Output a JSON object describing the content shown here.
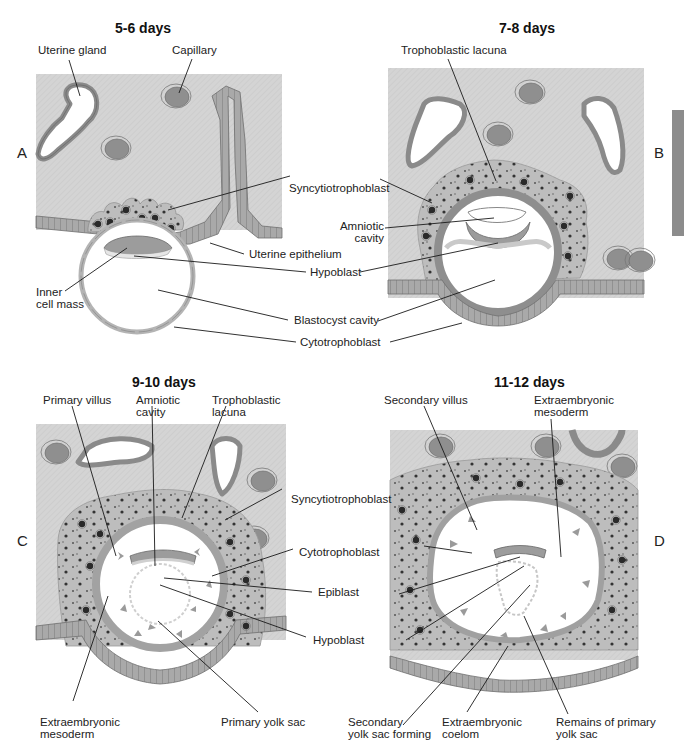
{
  "figure": {
    "type": "embryology-diagram",
    "colors": {
      "endometrium_stroma": "#d4d4d4",
      "epithelium_cells": "#a9a9a9",
      "cell_outline": "#6f6f6f",
      "syncytiotrophoblast": "#bdbdbd",
      "cytotrophoblast": "#9a9a9a",
      "capillary_blood": "#8f8f8f",
      "cavity": "#ffffff",
      "nuclei": "#2a2a2a",
      "leader_lines": "#1a1a1a",
      "side_tab": "#8c8c8c"
    }
  },
  "panels": [
    {
      "letter": "A",
      "title": "5-6 days",
      "labels": [
        {
          "id": "uterine-gland",
          "text": "Uterine gland"
        },
        {
          "id": "capillary",
          "text": "Capillary"
        },
        {
          "id": "inner-cell-mass-1",
          "text": "Inner"
        },
        {
          "id": "inner-cell-mass-2",
          "text": "cell mass"
        }
      ]
    },
    {
      "letter": "B",
      "title": "7-8 days",
      "labels": [
        {
          "id": "trophoblastic-lacuna",
          "text": "Trophoblastic lacuna"
        }
      ]
    },
    {
      "letter": "C",
      "title": "9-10 days",
      "labels": [
        {
          "id": "primary-villus",
          "text": "Primary villus"
        },
        {
          "id": "amniotic-cavity-1",
          "text": "Amniotic"
        },
        {
          "id": "amniotic-cavity-2",
          "text": "cavity"
        },
        {
          "id": "trophoblastic-lacuna-1",
          "text": "Trophoblastic"
        },
        {
          "id": "trophoblastic-lacuna-2",
          "text": "lacuna"
        },
        {
          "id": "extraembryonic-mesoderm-1",
          "text": "Extraembryonic"
        },
        {
          "id": "extraembryonic-mesoderm-2",
          "text": "mesoderm"
        },
        {
          "id": "primary-yolk-sac",
          "text": "Primary yolk sac"
        }
      ]
    },
    {
      "letter": "D",
      "title": "11-12 days",
      "labels": [
        {
          "id": "secondary-villus",
          "text": "Secondary villus"
        },
        {
          "id": "extraembryonic-mesoderm-1",
          "text": "Extraembryonic"
        },
        {
          "id": "extraembryonic-mesoderm-2",
          "text": "mesoderm"
        },
        {
          "id": "secondary-yolk-sac-1",
          "text": "Secondary"
        },
        {
          "id": "secondary-yolk-sac-2",
          "text": "yolk sac forming"
        },
        {
          "id": "extraembryonic-coelom-1",
          "text": "Extraembryonic"
        },
        {
          "id": "extraembryonic-coelom-2",
          "text": "coelom"
        },
        {
          "id": "remains-primary-yolk-sac-1",
          "text": "Remains of primary"
        },
        {
          "id": "remains-primary-yolk-sac-2",
          "text": "yolk sac"
        }
      ]
    }
  ],
  "shared_labels_top": [
    {
      "id": "syncytiotrophoblast",
      "text": "Syncytiotrophoblast"
    },
    {
      "id": "amniotic-cavity-1",
      "text": "Amniotic"
    },
    {
      "id": "amniotic-cavity-2",
      "text": "cavity"
    },
    {
      "id": "uterine-epithelium",
      "text": "Uterine epithelium"
    },
    {
      "id": "hypoblast",
      "text": "Hypoblast"
    },
    {
      "id": "blastocyst-cavity",
      "text": "Blastocyst cavity"
    },
    {
      "id": "cytotrophoblast",
      "text": "Cytotrophoblast"
    }
  ],
  "shared_labels_bottom": [
    {
      "id": "syncytiotrophoblast",
      "text": "Syncytiotrophoblast"
    },
    {
      "id": "cytotrophoblast",
      "text": "Cytotrophoblast"
    },
    {
      "id": "epiblast",
      "text": "Epiblast"
    },
    {
      "id": "hypoblast",
      "text": "Hypoblast"
    }
  ]
}
